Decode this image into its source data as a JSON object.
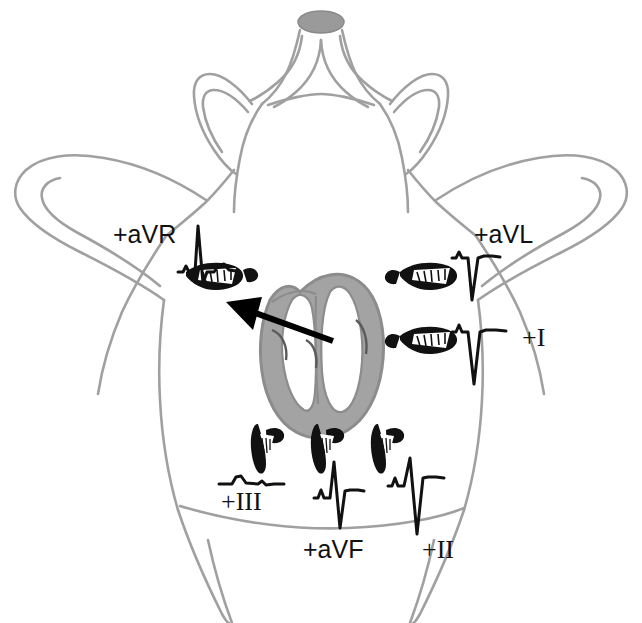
{
  "figure": {
    "background_color": "#ffffff",
    "outline_color": "#a0a0a0",
    "heart_fill_color": "#a3a3a3",
    "heart_outline_color": "#8c8c8c",
    "nose_fill_color": "#9a9a9a",
    "trace_color": "#111111",
    "electrode_color": "#111111",
    "axis_arrow_color": "#000000"
  },
  "leads": [
    {
      "id": "aVR",
      "label": "+aVR",
      "label_style": "sans",
      "label_x": 113,
      "label_y": 222,
      "polarity": "positive",
      "morphology": "tall R wave",
      "limb": "right-forelimb",
      "electrode_x": 210,
      "electrode_y": 273
    },
    {
      "id": "aVL",
      "label": "+aVL",
      "label_style": "sans",
      "label_x": 474,
      "label_y": 222,
      "polarity": "negative",
      "morphology": "deep QS complex",
      "limb": "left-forelimb",
      "electrode_x": 419,
      "electrode_y": 273
    },
    {
      "id": "I",
      "label": "+I",
      "label_style": "serif",
      "label_x": 522,
      "label_y": 325,
      "polarity": "negative",
      "morphology": "deep QS complex",
      "limb": "left-forelimb",
      "electrode_x": 419,
      "electrode_y": 337
    },
    {
      "id": "III",
      "label": "+III",
      "label_style": "serif",
      "label_x": 221,
      "label_y": 489,
      "polarity": "isoelectric",
      "morphology": "nearly flat, small P wave",
      "limb": "left-hindlimb",
      "electrode_x": 267,
      "electrode_y": 440
    },
    {
      "id": "aVF",
      "label": "+aVF",
      "label_style": "sans",
      "label_x": 303,
      "label_y": 537,
      "polarity": "negative",
      "morphology": "small r, deep S wave",
      "limb": "hindlimb",
      "electrode_x": 327,
      "electrode_y": 440
    },
    {
      "id": "II",
      "label": "+II",
      "label_style": "serif",
      "label_x": 422,
      "label_y": 537,
      "polarity": "negative",
      "morphology": "small r, very deep S wave",
      "limb": "right-hindlimb",
      "electrode_x": 387,
      "electrode_y": 440
    }
  ],
  "axis_arrow": {
    "name": "mean-electrical-axis-arrow",
    "tail_x": 333,
    "tail_y": 341,
    "tip_x": 228,
    "tip_y": 303,
    "direction": "up-left toward +aVR"
  },
  "heart": {
    "name": "heart-cross-section",
    "center_x": 322,
    "center_y": 348,
    "description": "Cross-sectioned heart with shaded myocardium and ventricular chambers"
  },
  "animal": {
    "name": "animal-body-outline",
    "view": "ventral",
    "parts": [
      "nose",
      "left-ear",
      "right-ear",
      "head",
      "thorax",
      "left-forelimb",
      "right-forelimb",
      "left-hindlimb",
      "right-hindlimb"
    ]
  }
}
